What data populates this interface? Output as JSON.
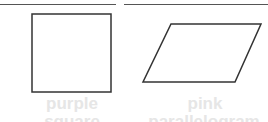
{
  "cards": [
    {
      "shape": "square",
      "label": "purple",
      "sublabel": "square"
    },
    {
      "shape": "parallelogram",
      "label": "pink",
      "sublabel": "parallelogram"
    }
  ]
}
